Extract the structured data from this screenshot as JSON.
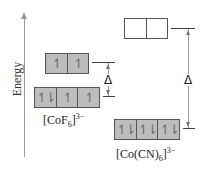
{
  "axis": {
    "label": "Energy"
  },
  "complexes": [
    {
      "name": "CoF6",
      "label_prefix": "[CoF",
      "label_sub": "6",
      "label_close": "]",
      "label_sup": "3−",
      "upper": {
        "orbitals": [
          "↿",
          "↿"
        ]
      },
      "lower": {
        "orbitals": [
          "↿⇂",
          "↿",
          "↿"
        ]
      },
      "splitting_symbol": "Δ"
    },
    {
      "name": "Co(CN)6",
      "label_prefix": "[Co(CN)",
      "label_sub": "6",
      "label_close": "]",
      "label_sup": "3−",
      "upper": {
        "orbitals": [
          "",
          ""
        ]
      },
      "lower": {
        "orbitals": [
          "↿⇂",
          "↿⇂",
          "↿⇂"
        ]
      },
      "splitting_symbol": "Δ"
    }
  ],
  "colors": {
    "filled_box": "#bdbdbd",
    "empty_box": "#ffffff",
    "axis": "#9a9a9a"
  }
}
